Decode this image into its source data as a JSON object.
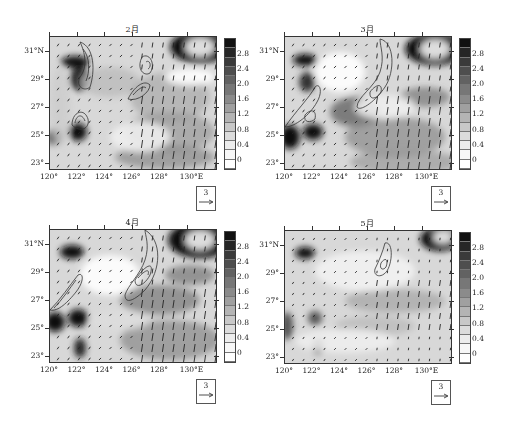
{
  "chart_data": [
    {
      "type": "heatmap",
      "title": "2月",
      "xlabel": "",
      "ylabel": "",
      "x_ticks": [
        "120°",
        "122°",
        "124°",
        "126°",
        "128°",
        "130°E"
      ],
      "y_ticks": [
        "31°N",
        "29°",
        "27°",
        "25°",
        "23°"
      ],
      "xlim": [
        120,
        132
      ],
      "ylim": [
        22.5,
        32
      ],
      "colorbar": {
        "ticks": [
          "2.8",
          "2.4",
          "2.0",
          "1.6",
          "1.2",
          "0.8",
          "0.4",
          "0"
        ],
        "range": [
          0,
          3.0
        ],
        "colormap": "grayscale (white=0, black=high)"
      },
      "overlays": [
        "wind vectors (arrows)",
        "contour lines"
      ],
      "reference_vector": "3",
      "features": "High values (dark) near Zhejiang coast ~29-30°N 121.5°E, ~25°N 121.5°E; strong dark arc NE corner ~31°N 130-131°E; contours near 122.5°E 30°N, 122°E 26°N, 126.5°E 30.5°N, 125.8°E 28°N; southward arrows east of 126°E"
    },
    {
      "type": "heatmap",
      "title": "3月",
      "x_ticks": [
        "120°",
        "122°",
        "124°",
        "126°",
        "128°",
        "130°E"
      ],
      "y_ticks": [
        "31°N",
        "29°",
        "27°",
        "25°",
        "23°"
      ],
      "xlim": [
        120,
        132
      ],
      "ylim": [
        22.5,
        32
      ],
      "colorbar": {
        "ticks": [
          "2.8",
          "2.4",
          "2.0",
          "1.6",
          "1.2",
          "0.8",
          "0.4",
          "0"
        ],
        "range": [
          0,
          3.0
        ]
      },
      "overlays": [
        "wind vectors (arrows)",
        "contour lines"
      ],
      "reference_vector": "3",
      "features": "Elongated contour band along 125-127°E 27-31°N; contour from 120°E 26°N to 122.5°E 29°N; dark patches at 25°N 120-121.5°E and NE corner"
    },
    {
      "type": "heatmap",
      "title": "4月",
      "x_ticks": [
        "120°",
        "122°",
        "124°",
        "126°",
        "128°",
        "130°E"
      ],
      "y_ticks": [
        "31°N",
        "29°",
        "27°",
        "25°",
        "23°"
      ],
      "xlim": [
        120,
        132
      ],
      "ylim": [
        22.5,
        32
      ],
      "colorbar": {
        "ticks": [
          "2.8",
          "2.4",
          "2.0",
          "1.6",
          "1.2",
          "0.8",
          "0.4",
          "0"
        ],
        "range": [
          0,
          3.0
        ]
      },
      "overlays": [
        "wind vectors (arrows)",
        "contour lines"
      ],
      "reference_vector": "3",
      "features": "Strong contour band 125.5-127.5°E 27.5-31°N; contour band 120.2-122.5°E 25.5-28.5°N; dark at 30°N 121.5°E, 25°N 120-122°E, NE corner"
    },
    {
      "type": "heatmap",
      "title": "5月",
      "x_ticks": [
        "120°",
        "122°",
        "124°",
        "126°",
        "128°",
        "130°E"
      ],
      "y_ticks": [
        "31°N",
        "29°",
        "27°",
        "25°",
        "23°"
      ],
      "xlim": [
        120,
        132
      ],
      "ylim": [
        22.5,
        32
      ],
      "colorbar": {
        "ticks": [
          "2.8",
          "2.4",
          "2.0",
          "1.6",
          "1.2",
          "0.8",
          "0.4",
          "0"
        ],
        "range": [
          0,
          3.0
        ]
      },
      "overlays": [
        "wind vectors (arrows)",
        "contour lines"
      ],
      "reference_vector": "3",
      "features": "Mostly light field; small contour at 126.5-127.5°E 29.3-30.8°N; dark at 30°N 121.5°E and NE corner; moderate grey band from 124°E 25°N to 131°E 28°N"
    }
  ],
  "panels": [
    {
      "title": "2月",
      "ref": "3"
    },
    {
      "title": "3月",
      "ref": "3"
    },
    {
      "title": "4月",
      "ref": "3"
    },
    {
      "title": "5月",
      "ref": "3"
    }
  ],
  "axes": {
    "x_ticks": [
      "120°",
      "122°",
      "124°",
      "126°",
      "128°",
      "130°E"
    ],
    "y_ticks": [
      "31°N",
      "29°",
      "27°",
      "25°",
      "23°"
    ]
  },
  "colorbar": {
    "labels": [
      "2.8",
      "2.4",
      "2.0",
      "1.6",
      "1.2",
      "0.8",
      "0.4",
      "0"
    ],
    "colors": [
      "#111111",
      "#262626",
      "#3a3a3a",
      "#4e4e4e",
      "#626262",
      "#777777",
      "#8b8b8b",
      "#a0a0a0",
      "#b4b4b4",
      "#c8c8c8",
      "#dcdcdc",
      "#ececec",
      "#f7f7f7",
      "#ffffff"
    ]
  }
}
